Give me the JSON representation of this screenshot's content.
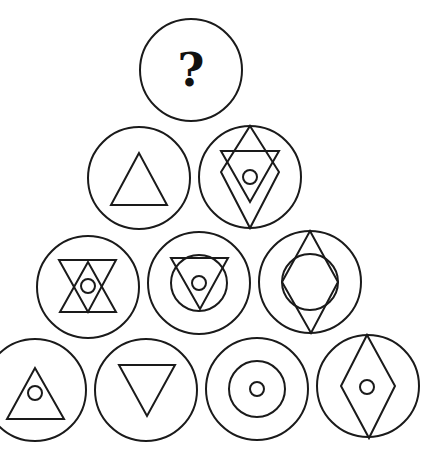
{
  "puzzle": {
    "title": "",
    "stroke_color": "#1a1a1a",
    "background": "#ffffff",
    "rows": [
      {
        "row": 1,
        "cells": [
          {
            "id": "c1",
            "cx": 191,
            "cy": 70,
            "r": 51,
            "label": "?",
            "elements": []
          }
        ]
      },
      {
        "row": 2,
        "cells": [
          {
            "id": "c2",
            "cx": 139,
            "cy": 178,
            "r": 51,
            "elements": [
              {
                "type": "polygon",
                "name": "upright-triangle",
                "points": "139,153 111,205 167,205"
              }
            ]
          },
          {
            "id": "c3",
            "cx": 250,
            "cy": 177,
            "r": 51,
            "elements": [
              {
                "type": "polygon",
                "name": "diamond",
                "points": "250,126 279,172 250,228 221,172"
              },
              {
                "type": "polygon",
                "name": "inverted-triangle",
                "points": "221,151 279,151 250,202"
              },
              {
                "type": "circle",
                "name": "small-circle",
                "cx": 250,
                "cy": 177,
                "r": 7
              }
            ]
          }
        ]
      },
      {
        "row": 3,
        "cells": [
          {
            "id": "c4",
            "cx": 88,
            "cy": 287,
            "r": 51,
            "elements": [
              {
                "type": "polygon",
                "name": "inverted-triangle",
                "points": "59,260 116,260 88,312"
              },
              {
                "type": "polygon",
                "name": "upright-triangle",
                "points": "88,262 60,312 116,312"
              },
              {
                "type": "circle",
                "name": "small-circle",
                "cx": 88,
                "cy": 286,
                "r": 7
              }
            ]
          },
          {
            "id": "c5",
            "cx": 199,
            "cy": 283,
            "r": 51,
            "elements": [
              {
                "type": "circle",
                "name": "inner-circle",
                "cx": 199,
                "cy": 283,
                "r": 28
              },
              {
                "type": "polygon",
                "name": "inverted-triangle",
                "points": "171,258 228,258 200,309"
              },
              {
                "type": "circle",
                "name": "small-circle",
                "cx": 199,
                "cy": 283,
                "r": 7
              }
            ]
          },
          {
            "id": "c6",
            "cx": 310,
            "cy": 282,
            "r": 51,
            "elements": [
              {
                "type": "polygon",
                "name": "diamond",
                "points": "310,231 338,282 311,333 282,282"
              },
              {
                "type": "circle",
                "name": "inner-circle",
                "cx": 310,
                "cy": 282,
                "r": 28
              }
            ]
          }
        ]
      },
      {
        "row": 4,
        "cells": [
          {
            "id": "c7",
            "cx": 35,
            "cy": 390,
            "r": 51,
            "elements": [
              {
                "type": "polygon",
                "name": "upright-triangle",
                "points": "35,368 7,419 64,419"
              },
              {
                "type": "circle",
                "name": "small-circle",
                "cx": 35,
                "cy": 393,
                "r": 7
              }
            ]
          },
          {
            "id": "c8",
            "cx": 146,
            "cy": 390,
            "r": 51,
            "elements": [
              {
                "type": "polygon",
                "name": "inverted-triangle",
                "points": "119,365 175,365 147,416"
              }
            ]
          },
          {
            "id": "c9",
            "cx": 257,
            "cy": 389,
            "r": 51,
            "elements": [
              {
                "type": "circle",
                "name": "inner-circle",
                "cx": 257,
                "cy": 389,
                "r": 28
              },
              {
                "type": "circle",
                "name": "small-circle",
                "cx": 257,
                "cy": 389,
                "r": 7
              }
            ]
          },
          {
            "id": "c10",
            "cx": 368,
            "cy": 386,
            "r": 51,
            "elements": [
              {
                "type": "polygon",
                "name": "diamond",
                "points": "367,335 395,386 369,438 341,386"
              },
              {
                "type": "circle",
                "name": "small-circle",
                "cx": 367,
                "cy": 387,
                "r": 7
              }
            ]
          }
        ]
      }
    ]
  }
}
